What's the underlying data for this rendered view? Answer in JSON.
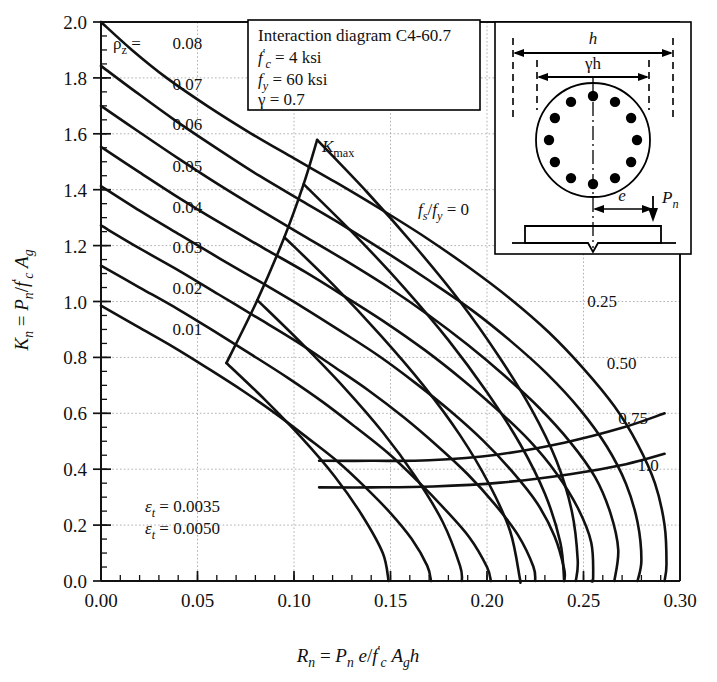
{
  "figure": {
    "title_box": {
      "line1": "Interaction diagram C4-60.7",
      "line2_sym": "f",
      "line2_sub": "c",
      "line2_prime": "′",
      "line2_val": "= 4 ksi",
      "line3_sym": "f",
      "line3_sub": "y",
      "line3_val": "= 60 ksi",
      "line4_sym": "γ",
      "line4_val": "= 0.7"
    },
    "inset": {
      "dim_h": "h",
      "dim_gh": "γh",
      "ecc": "e",
      "load": "P",
      "load_sub": "n",
      "bar_count": 12,
      "shape": "circular-column-section"
    },
    "kmax_label": "K",
    "kmax_sub": "max",
    "fs_fy_label_num": "f",
    "fs_fy_label_num_sub": "s",
    "fs_fy_label_den": "f",
    "fs_fy_label_den_sub": "y",
    "fs_fy_label_eq": "= 0",
    "eps_labels": [
      {
        "sym": "ε",
        "sub": "t",
        "eq": "= 0.0035"
      },
      {
        "sym": "ε",
        "sub": "t",
        "eq": "= 0.0050"
      }
    ],
    "rho_label_sym": "ρ",
    "rho_label_sub": "z",
    "rho_label_eq": "=",
    "colors": {
      "ink": "#111111",
      "grid": "#a9a9a9",
      "frame": "#000000"
    }
  },
  "chart_data": {
    "type": "line",
    "title": "Interaction diagram C4-60.7",
    "xlabel": "R_n = P_n e / f'_c A_g h",
    "ylabel": "K_n = P_n / f'_c A_g",
    "xlim": [
      0.0,
      0.3
    ],
    "ylim": [
      0.0,
      2.0
    ],
    "xticks": [
      0.0,
      0.05,
      0.1,
      0.15,
      0.2,
      0.25,
      0.3
    ],
    "xticklabels": [
      "0.00",
      "0.05",
      "0.10",
      "0.15",
      "0.20",
      "0.25",
      "0.30"
    ],
    "yticks": [
      0.0,
      0.2,
      0.4,
      0.6,
      0.8,
      1.0,
      1.2,
      1.4,
      1.6,
      1.8,
      2.0
    ],
    "yticklabels": [
      "0.0",
      "0.2",
      "0.4",
      "0.6",
      "0.8",
      "1.0",
      "1.2",
      "1.4",
      "1.6",
      "1.8",
      "2.0"
    ],
    "xminor_step": 0.01,
    "yminor_step": 0.05,
    "grid": true,
    "legend": "none",
    "parameters": {
      "fc_ksi": 4,
      "fy_ksi": 60,
      "gamma": 0.7,
      "section": "circular",
      "bars": 12
    },
    "rho_series": [
      {
        "name": "0.08",
        "label": "0.08",
        "points": [
          [
            0.0,
            2.0
          ],
          [
            0.016,
            1.9
          ],
          [
            0.034,
            1.8
          ],
          [
            0.055,
            1.7
          ],
          [
            0.078,
            1.6
          ],
          [
            0.1,
            1.512
          ],
          [
            0.122,
            1.425
          ],
          [
            0.145,
            1.33
          ],
          [
            0.168,
            1.23
          ],
          [
            0.19,
            1.125
          ],
          [
            0.212,
            1.01
          ],
          [
            0.232,
            0.89
          ],
          [
            0.25,
            0.76
          ],
          [
            0.266,
            0.625
          ],
          [
            0.278,
            0.49
          ],
          [
            0.287,
            0.35
          ],
          [
            0.292,
            0.2
          ],
          [
            0.293,
            0.06
          ],
          [
            0.292,
            0.0
          ]
        ]
      },
      {
        "name": "0.07",
        "label": "0.07",
        "points": [
          [
            0.0,
            1.843
          ],
          [
            0.018,
            1.75
          ],
          [
            0.038,
            1.65
          ],
          [
            0.06,
            1.548
          ],
          [
            0.082,
            1.45
          ],
          [
            0.104,
            1.36
          ],
          [
            0.126,
            1.27
          ],
          [
            0.148,
            1.175
          ],
          [
            0.17,
            1.075
          ],
          [
            0.192,
            0.97
          ],
          [
            0.212,
            0.86
          ],
          [
            0.231,
            0.742
          ],
          [
            0.248,
            0.615
          ],
          [
            0.262,
            0.482
          ],
          [
            0.272,
            0.348
          ],
          [
            0.278,
            0.21
          ],
          [
            0.28,
            0.075
          ],
          [
            0.278,
            0.0
          ]
        ]
      },
      {
        "name": "0.06",
        "label": "0.06",
        "points": [
          [
            0.0,
            1.7
          ],
          [
            0.019,
            1.61
          ],
          [
            0.04,
            1.512
          ],
          [
            0.061,
            1.418
          ],
          [
            0.083,
            1.325
          ],
          [
            0.105,
            1.235
          ],
          [
            0.127,
            1.145
          ],
          [
            0.149,
            1.05
          ],
          [
            0.17,
            0.95
          ],
          [
            0.19,
            0.845
          ],
          [
            0.209,
            0.735
          ],
          [
            0.227,
            0.62
          ],
          [
            0.243,
            0.498
          ],
          [
            0.256,
            0.372
          ],
          [
            0.264,
            0.242
          ],
          [
            0.268,
            0.112
          ],
          [
            0.266,
            0.0
          ]
        ]
      },
      {
        "name": "0.05",
        "label": "0.05",
        "points": [
          [
            0.0,
            1.553
          ],
          [
            0.02,
            1.462
          ],
          [
            0.041,
            1.368
          ],
          [
            0.062,
            1.28
          ],
          [
            0.084,
            1.192
          ],
          [
            0.106,
            1.105
          ],
          [
            0.127,
            1.015
          ],
          [
            0.148,
            0.922
          ],
          [
            0.168,
            0.825
          ],
          [
            0.187,
            0.722
          ],
          [
            0.205,
            0.615
          ],
          [
            0.222,
            0.502
          ],
          [
            0.236,
            0.385
          ],
          [
            0.247,
            0.262
          ],
          [
            0.254,
            0.138
          ],
          [
            0.255,
            0.012
          ],
          [
            0.254,
            0.0
          ]
        ]
      },
      {
        "name": "0.04",
        "label": "0.04",
        "points": [
          [
            0.0,
            1.413
          ],
          [
            0.02,
            1.325
          ],
          [
            0.041,
            1.238
          ],
          [
            0.062,
            1.152
          ],
          [
            0.083,
            1.068
          ],
          [
            0.104,
            0.982
          ],
          [
            0.124,
            0.895
          ],
          [
            0.144,
            0.805
          ],
          [
            0.163,
            0.708
          ],
          [
            0.181,
            0.608
          ],
          [
            0.198,
            0.502
          ],
          [
            0.213,
            0.392
          ],
          [
            0.226,
            0.278
          ],
          [
            0.235,
            0.16
          ],
          [
            0.24,
            0.042
          ],
          [
            0.24,
            0.0
          ]
        ]
      },
      {
        "name": "0.03",
        "label": "0.03",
        "points": [
          [
            0.0,
            1.272
          ],
          [
            0.02,
            1.19
          ],
          [
            0.041,
            1.108
          ],
          [
            0.061,
            1.025
          ],
          [
            0.081,
            0.942
          ],
          [
            0.101,
            0.858
          ],
          [
            0.12,
            0.77
          ],
          [
            0.139,
            0.68
          ],
          [
            0.157,
            0.585
          ],
          [
            0.174,
            0.485
          ],
          [
            0.19,
            0.382
          ],
          [
            0.204,
            0.275
          ],
          [
            0.216,
            0.165
          ],
          [
            0.224,
            0.052
          ],
          [
            0.225,
            0.0
          ]
        ]
      },
      {
        "name": "0.02",
        "label": "0.02",
        "points": [
          [
            0.0,
            1.128
          ],
          [
            0.02,
            1.05
          ],
          [
            0.04,
            0.972
          ],
          [
            0.059,
            0.892
          ],
          [
            0.078,
            0.81
          ],
          [
            0.097,
            0.726
          ],
          [
            0.115,
            0.64
          ],
          [
            0.132,
            0.55
          ],
          [
            0.149,
            0.456
          ],
          [
            0.164,
            0.358
          ],
          [
            0.178,
            0.258
          ],
          [
            0.191,
            0.155
          ],
          [
            0.2,
            0.05
          ],
          [
            0.202,
            0.0
          ]
        ]
      },
      {
        "name": "0.01",
        "label": "0.01",
        "points": [
          [
            0.0,
            0.985
          ],
          [
            0.019,
            0.91
          ],
          [
            0.038,
            0.835
          ],
          [
            0.056,
            0.758
          ],
          [
            0.074,
            0.678
          ],
          [
            0.091,
            0.596
          ],
          [
            0.107,
            0.512
          ],
          [
            0.123,
            0.425
          ],
          [
            0.137,
            0.335
          ],
          [
            0.15,
            0.243
          ],
          [
            0.161,
            0.15
          ],
          [
            0.169,
            0.055
          ],
          [
            0.171,
            0.0
          ]
        ]
      }
    ],
    "kmax_line": {
      "name": "K_max",
      "points": [
        [
          0.065,
          0.78
        ],
        [
          0.081,
          1.005
        ],
        [
          0.095,
          1.23
        ],
        [
          0.105,
          1.42
        ],
        [
          0.112,
          1.578
        ]
      ]
    },
    "fs_fy_series": [
      {
        "name": "0",
        "label": "f_s/f_y = 0",
        "points": [
          [
            0.112,
            1.578
          ],
          [
            0.138,
            1.39
          ],
          [
            0.163,
            1.195
          ],
          [
            0.186,
            1.0
          ],
          [
            0.206,
            0.805
          ],
          [
            0.223,
            0.615
          ],
          [
            0.236,
            0.43
          ],
          [
            0.244,
            0.248
          ],
          [
            0.247,
            0.075
          ],
          [
            0.246,
            0.0
          ]
        ]
      },
      {
        "name": "0.25",
        "label": "0.25",
        "points": [
          [
            0.105,
            1.42
          ],
          [
            0.132,
            1.235
          ],
          [
            0.157,
            1.05
          ],
          [
            0.18,
            0.862
          ],
          [
            0.2,
            0.675
          ],
          [
            0.217,
            0.492
          ],
          [
            0.23,
            0.312
          ],
          [
            0.238,
            0.138
          ],
          [
            0.24,
            0.0
          ]
        ]
      },
      {
        "name": "0.50",
        "label": "0.50",
        "points": [
          [
            0.095,
            1.23
          ],
          [
            0.121,
            1.055
          ],
          [
            0.145,
            0.878
          ],
          [
            0.167,
            0.7
          ],
          [
            0.186,
            0.522
          ],
          [
            0.201,
            0.348
          ],
          [
            0.212,
            0.178
          ],
          [
            0.217,
            0.01
          ],
          [
            0.217,
            0.0
          ]
        ]
      },
      {
        "name": "0.75",
        "label": "0.75",
        "points": [
          [
            0.081,
            1.005
          ],
          [
            0.104,
            0.85
          ],
          [
            0.126,
            0.692
          ],
          [
            0.146,
            0.532
          ],
          [
            0.163,
            0.372
          ],
          [
            0.177,
            0.212
          ],
          [
            0.186,
            0.055
          ],
          [
            0.187,
            0.0
          ]
        ]
      },
      {
        "name": "1.0",
        "label": "1.0",
        "points": [
          [
            0.065,
            0.78
          ],
          [
            0.085,
            0.648
          ],
          [
            0.104,
            0.512
          ],
          [
            0.121,
            0.375
          ],
          [
            0.135,
            0.238
          ],
          [
            0.146,
            0.1
          ],
          [
            0.149,
            0.0
          ]
        ]
      }
    ],
    "eps_series": [
      {
        "name": "0.0035",
        "label": "ε_t = 0.0035",
        "points": [
          [
            0.113,
            0.43
          ],
          [
            0.14,
            0.43
          ],
          [
            0.17,
            0.432
          ],
          [
            0.205,
            0.452
          ],
          [
            0.24,
            0.495
          ],
          [
            0.27,
            0.548
          ],
          [
            0.292,
            0.6
          ]
        ]
      },
      {
        "name": "0.0050",
        "label": "ε_t = 0.0050",
        "points": [
          [
            0.113,
            0.335
          ],
          [
            0.14,
            0.335
          ],
          [
            0.172,
            0.338
          ],
          [
            0.207,
            0.352
          ],
          [
            0.243,
            0.382
          ],
          [
            0.272,
            0.418
          ],
          [
            0.292,
            0.455
          ]
        ]
      }
    ],
    "balanced_envelope": {
      "name": "lower-left envelope",
      "points": [
        [
          0.0,
          0.985
        ],
        [
          0.019,
          0.91
        ],
        [
          0.038,
          0.835
        ],
        [
          0.056,
          0.758
        ],
        [
          0.074,
          0.678
        ],
        [
          0.091,
          0.596
        ],
        [
          0.107,
          0.512
        ],
        [
          0.123,
          0.425
        ],
        [
          0.137,
          0.335
        ],
        [
          0.15,
          0.243
        ],
        [
          0.161,
          0.15
        ],
        [
          0.169,
          0.055
        ],
        [
          0.171,
          0.0
        ]
      ]
    }
  }
}
